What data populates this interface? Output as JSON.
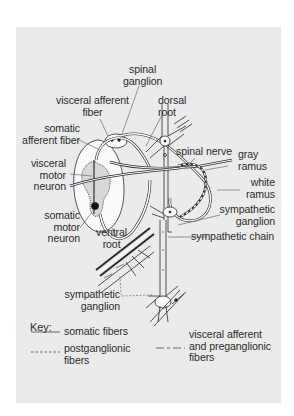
{
  "figure": {
    "type": "anatomical diagram",
    "background_color": "#ebebeb"
  },
  "labels": {
    "spinal_ganglion": [
      "spinal",
      "ganglion"
    ],
    "visceral_afferent_fiber": [
      "visceral afferent",
      "fiber"
    ],
    "dorsal_root": [
      "dorsal",
      "root"
    ],
    "somatic_afferent_fiber": [
      "somatic",
      "afferent fiber"
    ],
    "visceral_motor_neuron": [
      "visceral",
      "motor",
      "neuron"
    ],
    "spinal_nerve": "spinal nerve",
    "gray_ramus": [
      "gray",
      "ramus"
    ],
    "white_ramus": [
      "white",
      "ramus"
    ],
    "sympathetic_ganglion_right": [
      "sympathetic",
      "ganglion"
    ],
    "sympathetic_chain": "sympathetic chain",
    "somatic_motor_neuron": [
      "somatic",
      "motor",
      "neuron"
    ],
    "ventral_root": [
      "ventral",
      "root"
    ],
    "sympathetic_ganglion_bottom": [
      "sympathetic",
      "ganglion"
    ]
  },
  "key": {
    "title": "Key:",
    "items": [
      {
        "line_style": "solid",
        "label": [
          "somatic fibers"
        ]
      },
      {
        "line_style": "dashed-short",
        "label": [
          "postganglionic",
          "fibers"
        ]
      },
      {
        "line_style": "dash-long-short",
        "label": [
          "visceral afferent",
          "and preganglionic",
          "fibers"
        ]
      }
    ]
  }
}
